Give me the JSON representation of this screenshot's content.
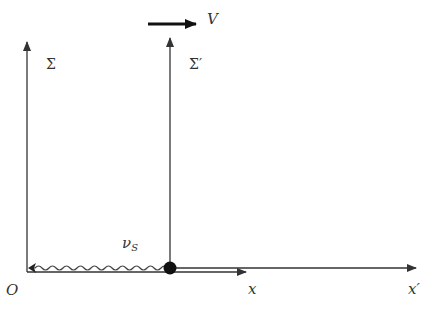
{
  "diagram": {
    "frames": [
      {
        "name": "Sigma",
        "label": "Σ"
      },
      {
        "name": "Sigma-prime",
        "label": "Σ′"
      }
    ],
    "velocity_label": "V",
    "origin_label": "O",
    "x_axis_label": "x",
    "x_prime_axis_label": "x′",
    "wave_label": "ν",
    "wave_label_subscript": "S",
    "colors": {
      "line": "#333333",
      "wave": "#444444",
      "dot": "#111111",
      "velocity_arrow": "#111111"
    }
  }
}
